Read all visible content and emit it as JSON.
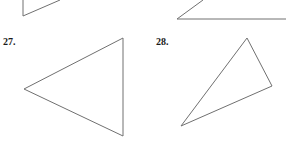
{
  "problems": [
    {
      "label": "27.",
      "shape": "triangle",
      "vertices": [
        [
          123,
          38
        ],
        [
          24,
          89
        ],
        [
          123,
          136
        ]
      ]
    },
    {
      "label": "28.",
      "shape": "triangle",
      "vertices": [
        [
          247,
          38
        ],
        [
          272,
          86
        ],
        [
          181,
          126
        ]
      ]
    }
  ],
  "partial_shapes_top": [
    {
      "points": [
        [
          60,
          0
        ],
        [
          23,
          16
        ],
        [
          23,
          0
        ]
      ]
    },
    {
      "points": [
        [
          203,
          0
        ],
        [
          177,
          19
        ],
        [
          286,
          19
        ]
      ]
    }
  ],
  "stroke_color": "#707070"
}
